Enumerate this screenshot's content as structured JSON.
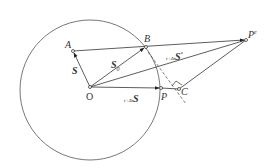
{
  "diagram": {
    "stroke_color": "#444444",
    "background": "#ffffff",
    "circle": {
      "cx": 90,
      "cy": 90,
      "r": 70
    },
    "points": {
      "O": {
        "label": "O",
        "x": 90,
        "y": 87
      },
      "A": {
        "label": "A",
        "x": 73,
        "y": 51
      },
      "B": {
        "label": "B",
        "x": 146,
        "y": 47
      },
      "P": {
        "label": "P",
        "x": 161,
        "y": 88
      },
      "C": {
        "label": "C",
        "x": 179,
        "y": 89
      },
      "Pe": {
        "label": "P",
        "sup": "e",
        "x": 246,
        "y": 40
      }
    },
    "labels": {
      "A": "A",
      "B": "B",
      "O": "O",
      "P": "P",
      "C": "C",
      "Pe_main": "P",
      "Pe_sup": "e",
      "vec_S": "S",
      "vec_S_prefix": "",
      "vec_S0": "S",
      "vec_S0_sub": "0",
      "vec_tdtS": "S",
      "vec_tdtS_prefix": "t+Δt",
      "vec_tdtSe": "S",
      "vec_tdtSe_prefix": "t+Δt",
      "vec_tdtSe_sup": "e"
    }
  }
}
